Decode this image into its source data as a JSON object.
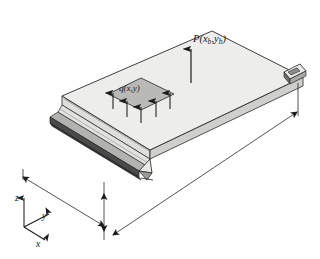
{
  "figure": {
    "background_color": "#ffffff",
    "line_color": "#1b1b1b"
  },
  "labels": {
    "point_load": {
      "name": "P",
      "open_paren": "(",
      "var_x": "x",
      "sub_x": "b",
      "comma": ",",
      "var_y": "y",
      "sub_y": "b",
      "close_paren": ")",
      "full_text": "P(xb,yb)"
    },
    "distributed_load": {
      "full_text": "q(x,y)"
    },
    "axes": {
      "z": "z",
      "y": "y",
      "x": "x"
    }
  },
  "geometry": {
    "plate": {
      "top_face_color": "#ededeb",
      "front_edge_color": "#d8d8d6",
      "side_band_color": "#4a4a4a",
      "outline_color": "#2a2a2a",
      "corners": {
        "top_left": [
          62,
          96
        ],
        "top_apex": [
          212,
          31
        ],
        "right": [
          303,
          77
        ],
        "bottom": [
          150,
          150
        ]
      },
      "thickness_px": 9
    },
    "load_patch": {
      "fill_color": "#b9b9b7",
      "outline_color": "#3a3a3a",
      "center": [
        141,
        94
      ],
      "half_width": 33,
      "half_height": 16
    },
    "supports": [
      {
        "name": "left-pin-support",
        "position": [
          104,
          192
        ]
      },
      {
        "name": "right-pin-support",
        "position": [
          292,
          80
        ]
      }
    ]
  },
  "arrows": {
    "point_load_arrow": {
      "tail": [
        191,
        82
      ],
      "head": [
        191,
        48
      ],
      "direction": "up",
      "count": 1
    },
    "distributed_load_arrows": {
      "direction": "up",
      "count": 5,
      "positions": [
        [
          113,
          109
        ],
        [
          127,
          116
        ],
        [
          141,
          122
        ],
        [
          156,
          116
        ],
        [
          170,
          109
        ]
      ],
      "length_px": 17
    }
  },
  "dimensions": [
    {
      "name": "width-dimension",
      "orientation": "left-edge-diagonal",
      "from": [
        23,
        176
      ],
      "to": [
        105,
        213
      ],
      "label": ""
    },
    {
      "name": "length-dimension",
      "orientation": "lower-right-diagonal",
      "from": [
        120,
        231
      ],
      "to": [
        297,
        111
      ],
      "label": ""
    },
    {
      "name": "thickness-dimension",
      "orientation": "vertical",
      "from": [
        104,
        196
      ],
      "to": [
        104,
        229
      ],
      "label": ""
    },
    {
      "name": "edge-depth-dimension",
      "orientation": "vertical-right",
      "from": [
        298,
        83
      ],
      "to": [
        298,
        115
      ],
      "label": ""
    }
  ],
  "axes_triad": {
    "origin": [
      24,
      227
    ],
    "z_tip": [
      24,
      196
    ],
    "y_tip": [
      52,
      213
    ],
    "x_tip": [
      48,
      243
    ]
  }
}
